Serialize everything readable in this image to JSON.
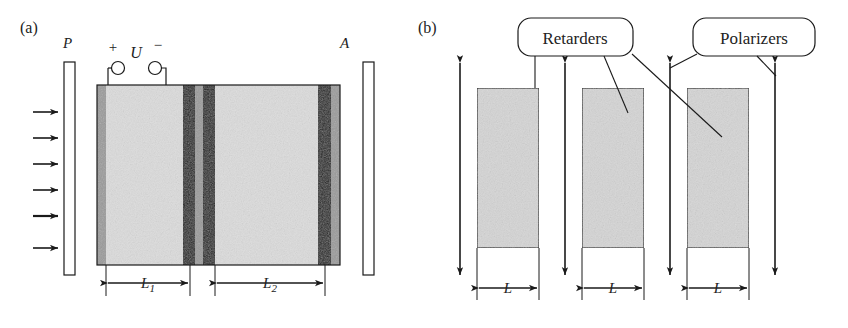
{
  "figure": {
    "type": "diagram",
    "colors": {
      "line": "#1a1a1a",
      "crystal_fill": "#d9d9d9",
      "electrode_gray": "#9a9a9a",
      "electrode_dark": "#1c1c1c",
      "block_fill": "#d5d5d5",
      "background": "#ffffff"
    }
  },
  "panel_a": {
    "label": "(a)",
    "polarizer_label": "P",
    "analyzer_label": "A",
    "voltage_label": "U",
    "plus_label": "+",
    "minus_label": "−",
    "length1_label": "L",
    "length1_sub": "1",
    "length2_label": "L",
    "length2_sub": "2",
    "beam_arrow_count": 6,
    "terminal_count": 2,
    "layers": [
      {
        "name": "electrode-gray-left",
        "fill": "electrode_gray",
        "x": 97,
        "w": 9
      },
      {
        "name": "crystal-segment-1",
        "fill": "crystal_fill",
        "x": 106,
        "w": 77
      },
      {
        "name": "electrode-dark-1",
        "fill": "electrode_dark",
        "x": 183,
        "w": 12
      },
      {
        "name": "electrode-gray-mid",
        "fill": "electrode_gray",
        "x": 195,
        "w": 8
      },
      {
        "name": "electrode-dark-2",
        "fill": "electrode_dark",
        "x": 203,
        "w": 12
      },
      {
        "name": "crystal-segment-2",
        "fill": "crystal_fill",
        "x": 215,
        "w": 103
      },
      {
        "name": "electrode-dark-3",
        "fill": "electrode_dark",
        "x": 318,
        "w": 13
      },
      {
        "name": "electrode-gray-right",
        "fill": "electrode_gray",
        "x": 331,
        "w": 9
      }
    ]
  },
  "panel_b": {
    "label": "(b)",
    "callout_retarders": "Retarders",
    "callout_polarizers": "Polarizers",
    "length_label": "L",
    "retarder_count": 3,
    "polarizer_arrow_count": 4,
    "blocks": [
      {
        "name": "retarder-1",
        "x": 477,
        "w": 62
      },
      {
        "name": "retarder-2",
        "x": 582,
        "w": 62
      },
      {
        "name": "retarder-3",
        "x": 687,
        "w": 62
      }
    ],
    "polarizer_arrows_x": [
      460,
      565,
      670,
      775
    ]
  }
}
